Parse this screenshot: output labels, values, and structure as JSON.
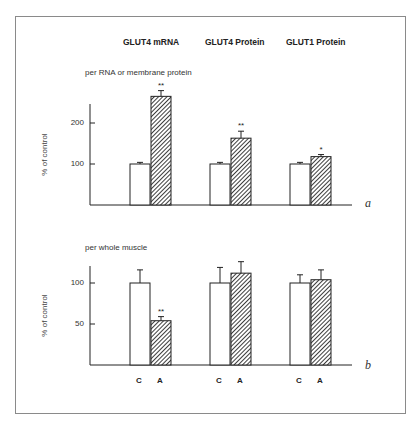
{
  "headers": [
    "GLUT4 mRNA",
    "GLUT4 Protein",
    "GLUT1 Protein"
  ],
  "panels": {
    "a": {
      "letter": "a",
      "subtitle": "per RNA or membrane protein",
      "ylabel": "% of control",
      "ticks": [
        "200",
        "100"
      ]
    },
    "b": {
      "letter": "b",
      "subtitle": "per whole muscle",
      "ylabel": "% of control",
      "ticks": [
        "100",
        "50"
      ],
      "xcats": [
        "C",
        "A",
        "C",
        "A",
        "C",
        "A"
      ]
    }
  },
  "colors": {
    "control_fill": "#ffffff",
    "treated_hatch": "#333333",
    "axis": "#222222",
    "frame": "#8a8a8a"
  },
  "chart_data": [
    {
      "type": "bar",
      "panel": "a",
      "title": "per RNA or membrane protein",
      "categories": [
        "GLUT4 mRNA",
        "GLUT4 Protein",
        "GLUT1 Protein"
      ],
      "series": [
        {
          "name": "C",
          "values": [
            100,
            100,
            100
          ],
          "errors": [
            4,
            4,
            4
          ],
          "significance": [
            "",
            "",
            ""
          ]
        },
        {
          "name": "A",
          "values": [
            265,
            163,
            118
          ],
          "errors": [
            14,
            17,
            5
          ],
          "significance": [
            "**",
            "**",
            "*"
          ]
        }
      ],
      "xlabel": "",
      "ylabel": "% of control",
      "yticks": [
        100,
        200
      ],
      "ylim": [
        0,
        280
      ],
      "grid": false,
      "legend": "none"
    },
    {
      "type": "bar",
      "panel": "b",
      "title": "per whole muscle",
      "categories": [
        "GLUT4 mRNA",
        "GLUT4 Protein",
        "GLUT1 Protein"
      ],
      "series": [
        {
          "name": "C",
          "values": [
            100,
            100,
            100
          ],
          "errors": [
            16,
            19,
            10
          ],
          "significance": [
            "",
            "",
            ""
          ]
        },
        {
          "name": "A",
          "values": [
            54,
            112,
            104
          ],
          "errors": [
            5,
            14,
            12
          ],
          "significance": [
            "**",
            "",
            ""
          ]
        }
      ],
      "xlabel": "",
      "ylabel": "% of control",
      "yticks": [
        50,
        100
      ],
      "ylim": [
        0,
        125
      ],
      "grid": false,
      "legend": "none"
    }
  ]
}
